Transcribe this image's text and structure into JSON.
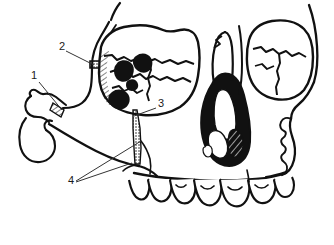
{
  "figure": {
    "background_color": "#ffffff",
    "ink_color": "#111111",
    "width": 334,
    "height": 245
  },
  "callouts": [
    {
      "id": "callout-1",
      "label": "1",
      "label_x": 31,
      "label_y": 79,
      "leader_from_x": 39,
      "leader_from_y": 82,
      "leader_to_x": 62,
      "leader_to_y": 110,
      "target": "left-condylar-fracture-line"
    },
    {
      "id": "callout-2",
      "label": "2",
      "label_x": 59,
      "label_y": 50,
      "leader_from_x": 66,
      "leader_from_y": 51,
      "leader_to_x": 94,
      "leader_to_y": 65,
      "target": "zygomatic-arch-fracture"
    },
    {
      "id": "callout-3",
      "label": "3",
      "label_x": 158,
      "label_y": 107,
      "leader_from_x": 156,
      "leader_from_y": 108,
      "leader_to_x": 134,
      "leader_to_y": 116,
      "target": "vertical-maxillary-fracture-line"
    },
    {
      "id": "callout-4",
      "label": "4",
      "label_x": 68,
      "label_y": 184,
      "leaders": [
        {
          "from_x": 76,
          "from_y": 181,
          "to_x": 141,
          "to_y": 141
        },
        {
          "from_x": 76,
          "from_y": 182,
          "to_x": 132,
          "to_y": 163
        }
      ],
      "target": "mandibular-and-alveolar-fracture-sites"
    }
  ],
  "regions": [
    {
      "name": "left-zygomatic-body",
      "shading": "diagonal-hatch"
    },
    {
      "name": "left-orbital-floor-defect",
      "shading": "solid-black"
    },
    {
      "name": "nasal-aperture-turbinates",
      "shading": "solid-black-with-white-striae"
    },
    {
      "name": "right-orbit",
      "shading": "outline"
    },
    {
      "name": "maxillary-dentition",
      "shading": "outline"
    },
    {
      "name": "mandible-body",
      "shading": "outline"
    },
    {
      "name": "fracture-line-stippled",
      "shading": "stipple"
    }
  ]
}
